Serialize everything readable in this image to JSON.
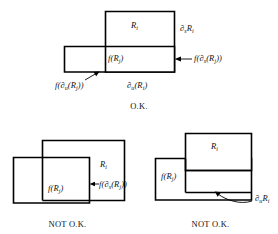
{
  "figure": {
    "kind": "mathematical-diagram",
    "background_color": "#ffffff",
    "line_color": "#000000",
    "text_color": "#111111"
  },
  "panels": [
    {
      "id": "top",
      "caption": "O.K.",
      "rects": [
        {
          "name": "R_i",
          "x": 105,
          "y": 11,
          "w": 70,
          "h": 61
        },
        {
          "name": "f(R_j)",
          "x": 64,
          "y": 46,
          "w": 111,
          "h": 26
        }
      ],
      "labels": [
        {
          "id": "ri",
          "base": "R",
          "sub": "i",
          "prefix": "",
          "suffix": ""
        },
        {
          "id": "ds-ri",
          "text": "∂sRi"
        },
        {
          "id": "fds-rj",
          "text": "f(∂s(Rj))"
        },
        {
          "id": "frj",
          "text": "f(Rj)"
        },
        {
          "id": "fdu-rj",
          "text": "f(∂u(Rj))"
        },
        {
          "id": "du-ri",
          "text": "∂u(Ri)"
        }
      ]
    },
    {
      "id": "bottom-left",
      "caption": "NOT O.K.",
      "rects": [
        {
          "name": "R_i",
          "x": 42,
          "y": 140,
          "w": 83,
          "h": 61
        },
        {
          "name": "f(R_j)",
          "x": 13,
          "y": 157,
          "w": 77,
          "h": 46
        }
      ],
      "labels": [
        {
          "id": "ri",
          "text": "Ri"
        },
        {
          "id": "frj",
          "text": "f(Rj)"
        },
        {
          "id": "fds-rj",
          "text": "f(∂s(Rj))"
        }
      ]
    },
    {
      "id": "bottom-right",
      "caption": "NOT O.K.",
      "rects": [
        {
          "name": "R_i",
          "x": 185,
          "y": 133,
          "w": 67,
          "h": 37
        },
        {
          "name": "f(R_j)",
          "x": 155,
          "y": 158,
          "w": 97,
          "h": 42
        }
      ],
      "labels": [
        {
          "id": "ri",
          "text": "Ri"
        },
        {
          "id": "frj",
          "text": "f(Rj)"
        },
        {
          "id": "du-ri",
          "text": "∂uRi"
        }
      ]
    }
  ],
  "text": {
    "ok_caption": "O.K.",
    "not_ok_caption_left": "NOT O.K.",
    "not_ok_caption_right": "NOT O.K.",
    "R": "R",
    "f": "f",
    "partial": "∂",
    "sub_i": "i",
    "sub_j": "j",
    "sub_s": "s",
    "sub_u": "u",
    "lparen": "(",
    "rparen": ")",
    "top": {
      "label_Ri": "R",
      "label_Ri_sub": "i",
      "label_dsRi_partial": "∂",
      "label_dsRi_sub_s": "s",
      "label_dsRi_R": "R",
      "label_dsRi_sub_i": "i",
      "label_fdsRj": "f(",
      "label_fdsRj_partial": "∂",
      "label_fdsRj_sub_s": "s",
      "label_fdsRj_mid": "(R",
      "label_fdsRj_sub_j": "j",
      "label_fdsRj_end": "))",
      "label_fRj": "f(R",
      "label_fRj_sub": "j",
      "label_fRj_end": ")",
      "label_fduRj": "f(",
      "label_fduRj_partial": "∂",
      "label_fduRj_sub_u": "u",
      "label_fduRj_mid": "(R",
      "label_fduRj_sub_j": "j",
      "label_fduRj_end": "))",
      "label_duRi_partial": "∂",
      "label_duRi_sub_u": "u",
      "label_duRi_mid": "(R",
      "label_duRi_sub_i": "i",
      "label_duRi_end": ")"
    },
    "bottom_left": {
      "label_Ri": "R",
      "label_Ri_sub": "i",
      "label_fRj": "f(R",
      "label_fRj_sub": "j",
      "label_fRj_end": ")",
      "label_fdsRj": "f(",
      "label_fdsRj_partial": "∂",
      "label_fdsRj_sub_s": "s",
      "label_fdsRj_mid": "(R",
      "label_fdsRj_sub_j": "j",
      "label_fdsRj_end": "))"
    },
    "bottom_right": {
      "label_Ri": "R",
      "label_Ri_sub": "i",
      "label_fRj": "f(R",
      "label_fRj_sub": "j",
      "label_fRj_end": ")",
      "label_duRi_partial": "∂",
      "label_duRi_sub_u": "u",
      "label_duRi_R": "R",
      "label_duRi_sub_i": "i"
    }
  }
}
